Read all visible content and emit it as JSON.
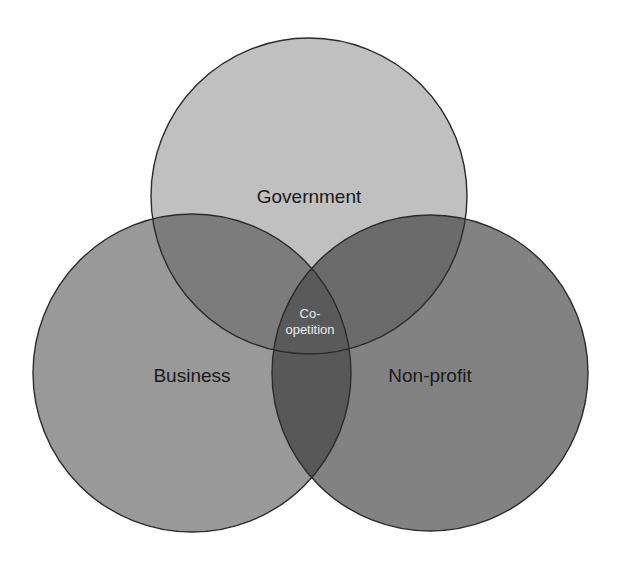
{
  "diagram": {
    "type": "venn",
    "sets": [
      {
        "id": "government",
        "label": "Government",
        "cx": 309,
        "cy": 196,
        "r": 158,
        "fill": "#c0c0c0"
      },
      {
        "id": "business",
        "label": "Business",
        "cx": 192,
        "cy": 373,
        "r": 159,
        "fill": "#999999"
      },
      {
        "id": "nonprofit",
        "label": "Non-profit",
        "cx": 430,
        "cy": 373,
        "r": 158,
        "fill": "#828282"
      }
    ],
    "intersections": {
      "government_business": {
        "fill": "#7c7c7c"
      },
      "government_nonprofit": {
        "fill": "#6b6b6b"
      },
      "business_nonprofit": {
        "fill": "#585858"
      },
      "all": {
        "fill": "#5a5a5a",
        "label_line1": "Co-",
        "label_line2": "opetition"
      }
    },
    "outline_color": "#2b2b2b"
  }
}
